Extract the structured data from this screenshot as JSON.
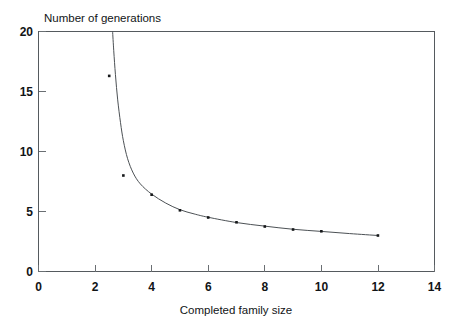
{
  "chart_data": {
    "type": "line",
    "title": "",
    "xlabel": "Completed family size",
    "ylabel": "Number of generations",
    "xlim": [
      0,
      14
    ],
    "ylim": [
      0,
      20
    ],
    "xticks": [
      0,
      2,
      4,
      6,
      8,
      10,
      12,
      14
    ],
    "xtick_labels": [
      "0",
      "2",
      "4",
      "6",
      "8",
      "10",
      "12",
      "14"
    ],
    "yticks": [
      0,
      5,
      10,
      15,
      20
    ],
    "ytick_labels": [
      "0",
      "5",
      "10",
      "15",
      "20"
    ],
    "grid": false,
    "legend": null,
    "marker": "square",
    "marker_color": "#16181a",
    "line_color": "#4c5155",
    "axis_color": "#555a5e",
    "background_color": "#ffffff",
    "x": [
      2.5,
      3.0,
      4.0,
      5.0,
      6.0,
      7.0,
      8.0,
      9.0,
      10.0,
      12.0
    ],
    "y": [
      16.3,
      8.0,
      6.4,
      5.1,
      4.5,
      4.1,
      3.75,
      3.5,
      3.35,
      3.0
    ],
    "series": [
      {
        "name": "generations",
        "x": [
          2.5,
          3.0,
          4.0,
          5.0,
          6.0,
          7.0,
          8.0,
          9.0,
          10.0,
          12.0
        ],
        "values": [
          16.3,
          8.0,
          6.4,
          5.1,
          4.5,
          4.1,
          3.75,
          3.5,
          3.35,
          3.0
        ]
      }
    ],
    "curve_points": [
      [
        2.62,
        20.0
      ],
      [
        2.66,
        18.4
      ],
      [
        2.72,
        16.4
      ],
      [
        2.8,
        14.3
      ],
      [
        2.9,
        12.4
      ],
      [
        3.0,
        10.9
      ],
      [
        3.15,
        9.4
      ],
      [
        3.35,
        8.2
      ],
      [
        3.6,
        7.3
      ],
      [
        4.0,
        6.45
      ],
      [
        4.5,
        5.7
      ],
      [
        5.0,
        5.15
      ],
      [
        5.5,
        4.8
      ],
      [
        6.0,
        4.52
      ],
      [
        7.0,
        4.08
      ],
      [
        8.0,
        3.78
      ],
      [
        9.0,
        3.52
      ],
      [
        10.0,
        3.34
      ],
      [
        11.0,
        3.16
      ],
      [
        12.0,
        3.0
      ]
    ]
  }
}
